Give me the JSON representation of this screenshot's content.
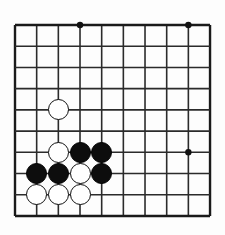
{
  "app": {
    "title": "Go Board Position",
    "kind": "go-board-diagram"
  },
  "board": {
    "label": "Go board corner diagram",
    "background_color": "#fdfdfd",
    "line_color": "#2b2b2b",
    "edge_line_color": "#1a1a1a",
    "star_point_color": "#111111",
    "cols": 10,
    "rows": 10,
    "origin_x": 15,
    "origin_y": 25,
    "spacing_x": 21.67,
    "spacing_y": 21.22,
    "line_width": 1.6,
    "edge_line_width": 2.4,
    "star_radius": 3.2,
    "stone_diameter": 21,
    "col_labels": [
      "1",
      "2",
      "3",
      "4",
      "5",
      "6",
      "7",
      "8",
      "9",
      "10"
    ],
    "row_labels": [
      "1",
      "2",
      "3",
      "4",
      "5",
      "6",
      "7",
      "8",
      "9",
      "10"
    ]
  },
  "star_points": [
    {
      "name": "star-point-c4-r1",
      "col": 4,
      "row": 1
    },
    {
      "name": "star-point-c9-r1",
      "col": 9,
      "row": 1
    },
    {
      "name": "star-point-c9-r7",
      "col": 9,
      "row": 7
    }
  ],
  "stones": [
    {
      "name": "stone-white-c3-r5",
      "color": "white",
      "col": 3,
      "row": 5
    },
    {
      "name": "stone-white-c3-r7",
      "color": "white",
      "col": 3,
      "row": 7
    },
    {
      "name": "stone-black-c4-r7",
      "color": "black",
      "col": 4,
      "row": 7
    },
    {
      "name": "stone-black-c5-r7",
      "color": "black",
      "col": 5,
      "row": 7
    },
    {
      "name": "stone-black-c2-r8",
      "color": "black",
      "col": 2,
      "row": 8
    },
    {
      "name": "stone-black-c3-r8",
      "color": "black",
      "col": 3,
      "row": 8
    },
    {
      "name": "stone-white-c4-r8",
      "color": "white",
      "col": 4,
      "row": 8
    },
    {
      "name": "stone-black-c5-r8",
      "color": "black",
      "col": 5,
      "row": 8
    },
    {
      "name": "stone-white-c2-r9",
      "color": "white",
      "col": 2,
      "row": 9
    },
    {
      "name": "stone-white-c3-r9",
      "color": "white",
      "col": 3,
      "row": 9
    },
    {
      "name": "stone-white-c4-r9",
      "color": "white",
      "col": 4,
      "row": 9
    }
  ],
  "counts": {
    "black_stones": 5,
    "white_stones": 6,
    "total_stones": 11
  }
}
